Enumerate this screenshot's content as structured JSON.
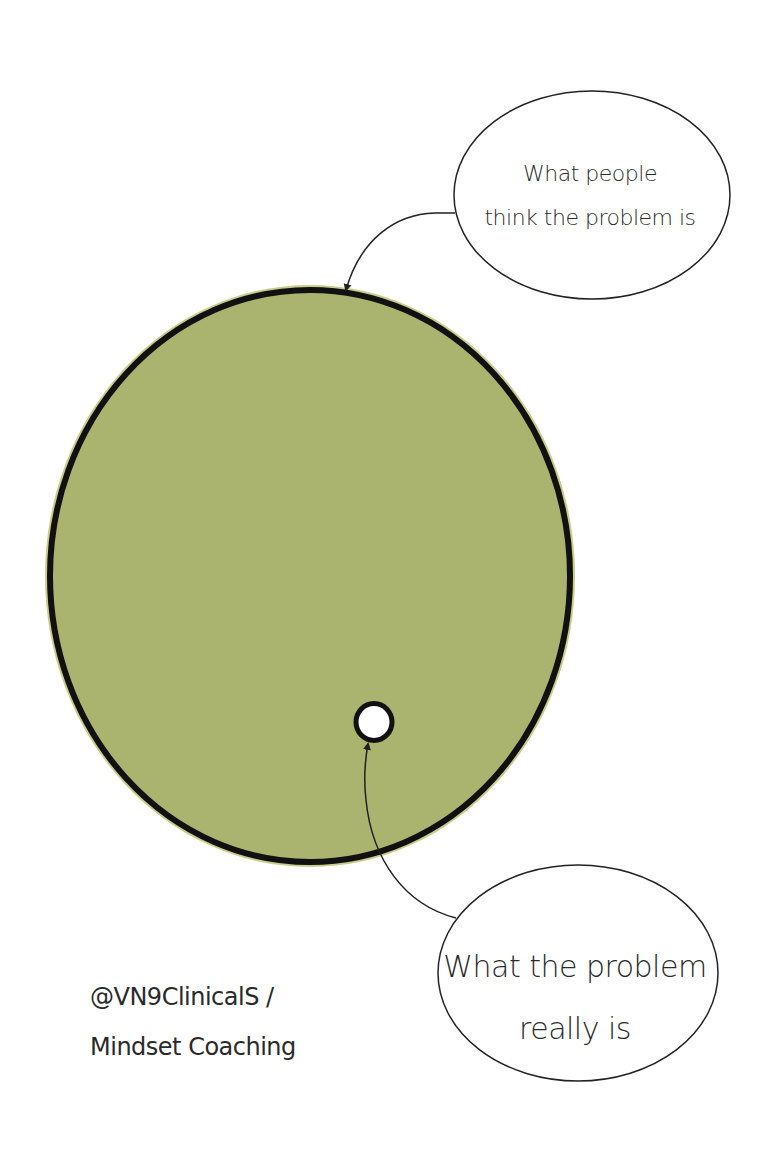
{
  "diagram": {
    "type": "iceberg-circle-metaphor",
    "colors": {
      "big_circle_fill": "#aab46e",
      "big_circle_halo": "#c9cc8a",
      "outline": "#111111",
      "small_circle_fill": "#ffffff",
      "bubble_fill": "#ffffff",
      "text": "#2a2a2a"
    },
    "big_circle": {
      "label": "What people think the problem is",
      "cx": 310,
      "cy": 576,
      "rx": 262,
      "ry": 288
    },
    "small_circle": {
      "label": "What the problem really is",
      "cx": 374,
      "cy": 722,
      "r": 18
    },
    "bubbles": {
      "top": {
        "lines": [
          "What people",
          "think the problem is"
        ],
        "cx": 592,
        "cy": 195,
        "rx": 138,
        "ry": 104
      },
      "bottom": {
        "lines": [
          "What the problem",
          "really is"
        ],
        "cx": 578,
        "cy": 973,
        "rx": 140,
        "ry": 108
      }
    }
  },
  "credit": {
    "lines": [
      "@VN9ClinicalS /",
      "Mindset Coaching"
    ]
  }
}
